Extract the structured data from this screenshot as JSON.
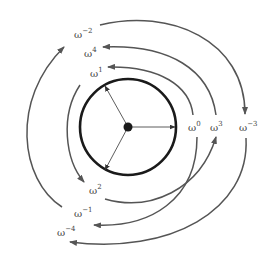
{
  "diagram": {
    "center_point": {
      "x": 128,
      "y": 127
    },
    "circle_radius": 48,
    "colors": {
      "circle": "#1a1a1a",
      "arrow": "#555555",
      "label": "#444444"
    },
    "labels": [
      {
        "id": "w0",
        "base": "ω",
        "exp": "0",
        "x": 188,
        "y": 131
      },
      {
        "id": "w3",
        "base": "ω",
        "exp": "3",
        "x": 210,
        "y": 131
      },
      {
        "id": "wm3",
        "base": "ω",
        "exp": "−3",
        "x": 239,
        "y": 131
      },
      {
        "id": "w1",
        "base": "ω",
        "exp": "1",
        "x": 90,
        "y": 77
      },
      {
        "id": "w4",
        "base": "ω",
        "exp": "4",
        "x": 84,
        "y": 57
      },
      {
        "id": "wm2",
        "base": "ω",
        "exp": "−2",
        "x": 74,
        "y": 38
      },
      {
        "id": "w2",
        "base": "ω",
        "exp": "2",
        "x": 89,
        "y": 194
      },
      {
        "id": "wm1",
        "base": "ω",
        "exp": "−1",
        "x": 74,
        "y": 217
      },
      {
        "id": "wm4",
        "base": "ω",
        "exp": "−4",
        "x": 57,
        "y": 236
      }
    ],
    "transitions": [
      {
        "from": "ω^0",
        "to": "ω^1"
      },
      {
        "from": "ω^1",
        "to": "ω^2"
      },
      {
        "from": "ω^2",
        "to": "ω^3"
      },
      {
        "from": "ω^3",
        "to": "ω^4"
      },
      {
        "from": "ω^0",
        "to": "ω^-1"
      },
      {
        "from": "ω^-1",
        "to": "ω^-2"
      },
      {
        "from": "ω^-2",
        "to": "ω^-3"
      },
      {
        "from": "ω^-3",
        "to": "ω^-4"
      }
    ]
  }
}
